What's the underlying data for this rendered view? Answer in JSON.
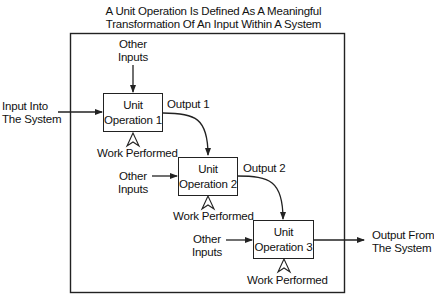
{
  "title": {
    "line1": "A Unit Operation Is Defined As A Meaningful",
    "line2": "Transformation Of An Input Within A System"
  },
  "system": {
    "input_line1": "Input Into",
    "input_line2": "The System",
    "output_line1": "Output From",
    "output_line2": "The System"
  },
  "units": [
    {
      "line1": "Unit",
      "line2": "Operation 1",
      "other_inputs_line1": "Other",
      "other_inputs_line2": "Inputs",
      "work": "Work Performed",
      "output": "Output 1"
    },
    {
      "line1": "Unit",
      "line2": "Operation 2",
      "other_inputs_line1": "Other",
      "other_inputs_line2": "Inputs",
      "work": "Work Performed",
      "output": "Output 2"
    },
    {
      "line1": "Unit",
      "line2": "Operation 3",
      "other_inputs_line1": "Other",
      "other_inputs_line2": "Inputs",
      "work": "Work Performed"
    }
  ],
  "colors": {
    "line": "#222222",
    "background": "#ffffff"
  }
}
